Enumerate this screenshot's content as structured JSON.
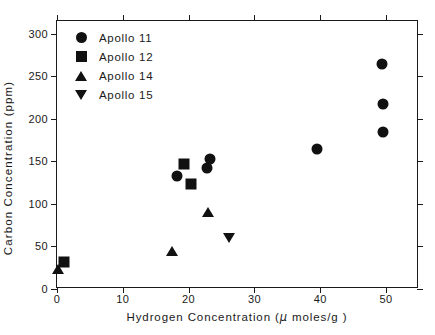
{
  "chart_data": {
    "type": "scatter",
    "title": "",
    "xlabel": "Hydrogen Concentration (μ moles/g)",
    "xlabel_prefix": "Hydrogen  Concentration  (",
    "xlabel_mu": "μ",
    "xlabel_suffix": " moles/g )",
    "ylabel": "Carbon  Concentration  (ppm)",
    "xlim": [
      0,
      55
    ],
    "ylim": [
      0,
      315
    ],
    "xticks": [
      0,
      10,
      20,
      30,
      40,
      50
    ],
    "xticklabels": [
      "0",
      "10",
      "20",
      "30",
      "40",
      "50"
    ],
    "yticks": [
      0,
      50,
      100,
      150,
      200,
      250,
      300
    ],
    "yticklabels": [
      "0",
      "50",
      "100",
      "150",
      "200",
      "250",
      "300"
    ],
    "grid": false,
    "legend_position": "upper left",
    "marker_color": "#111111",
    "axis_color": "#1a1a1a",
    "background": "#ffffff",
    "series": [
      {
        "name": "Apollo 11",
        "marker": "circle",
        "points": [
          {
            "x": 18.3,
            "y": 133
          },
          {
            "x": 22.8,
            "y": 142
          },
          {
            "x": 23.2,
            "y": 153
          },
          {
            "x": 39.5,
            "y": 164
          },
          {
            "x": 49.6,
            "y": 184
          },
          {
            "x": 49.6,
            "y": 218
          },
          {
            "x": 49.4,
            "y": 265
          }
        ]
      },
      {
        "name": "Apollo 12",
        "marker": "square",
        "points": [
          {
            "x": 1.0,
            "y": 32
          },
          {
            "x": 19.3,
            "y": 147
          },
          {
            "x": 20.4,
            "y": 124
          }
        ]
      },
      {
        "name": "Apollo 14",
        "marker": "triangle-up",
        "points": [
          {
            "x": 0.2,
            "y": 24
          },
          {
            "x": 17.5,
            "y": 45
          },
          {
            "x": 23.0,
            "y": 90
          }
        ]
      },
      {
        "name": "Apollo 15",
        "marker": "triangle-down",
        "points": [
          {
            "x": 26.1,
            "y": 60
          }
        ]
      }
    ]
  }
}
